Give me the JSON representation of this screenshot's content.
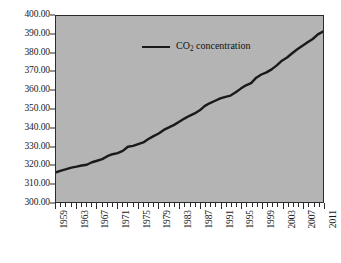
{
  "chart_data": {
    "type": "line",
    "title": "",
    "xlabel": "",
    "ylabel": "",
    "xlim": [
      1959,
      2011
    ],
    "ylim": [
      300.0,
      400.0
    ],
    "grid": false,
    "legend_position": "top-left-inside",
    "background_color": "#b4b4b4",
    "line_color": "#1a1a1a",
    "frame_color": "#2b2b2b",
    "y_ticks": [
      300.0,
      310.0,
      320.0,
      330.0,
      340.0,
      350.0,
      360.0,
      370.0,
      380.0,
      390.0,
      400.0
    ],
    "y_tick_labels": [
      "300.00",
      "310.00",
      "320.00",
      "330.00",
      "340.00",
      "350.00",
      "360.00",
      "370.00",
      "380.00",
      "390.00",
      "400.00"
    ],
    "x_ticks": [
      1959,
      1963,
      1967,
      1971,
      1975,
      1979,
      1983,
      1987,
      1991,
      1995,
      1999,
      2003,
      2007,
      2011
    ],
    "x_tick_labels": [
      "1959",
      "1963",
      "1967",
      "1971",
      "1975",
      "1979",
      "1983",
      "1987",
      "1991",
      "1995",
      "1999",
      "2003",
      "2007",
      "2011"
    ],
    "x_minor_tick_step": 1,
    "series": [
      {
        "name": "CO2 concentration",
        "name_html": "CO<sub>2</sub> concentration",
        "x": [
          1959,
          1960,
          1961,
          1962,
          1963,
          1964,
          1965,
          1966,
          1967,
          1968,
          1969,
          1970,
          1971,
          1972,
          1973,
          1974,
          1975,
          1976,
          1977,
          1978,
          1979,
          1980,
          1981,
          1982,
          1983,
          1984,
          1985,
          1986,
          1987,
          1988,
          1989,
          1990,
          1991,
          1992,
          1993,
          1994,
          1995,
          1996,
          1997,
          1998,
          1999,
          2000,
          2001,
          2002,
          2003,
          2004,
          2005,
          2006,
          2007,
          2008,
          2009,
          2010,
          2011
        ],
        "values": [
          315.97,
          316.91,
          317.64,
          318.45,
          318.99,
          319.62,
          320.04,
          321.37,
          322.18,
          323.05,
          324.62,
          325.68,
          326.32,
          327.46,
          329.68,
          330.19,
          331.12,
          332.03,
          333.84,
          335.41,
          336.84,
          338.76,
          340.12,
          341.48,
          343.15,
          344.85,
          346.35,
          347.61,
          349.31,
          351.69,
          353.2,
          354.45,
          355.7,
          356.54,
          357.21,
          358.96,
          360.97,
          362.74,
          363.88,
          366.84,
          368.54,
          369.71,
          371.32,
          373.45,
          375.98,
          377.7,
          379.98,
          382.09,
          384.02,
          385.83,
          387.64,
          390.1,
          391.63
        ]
      }
    ]
  },
  "legend": {
    "entries": [
      {
        "label": "CO2 concentration",
        "label_html": "CO<sub>2</sub> concentration",
        "color": "#1a1a1a"
      }
    ]
  }
}
